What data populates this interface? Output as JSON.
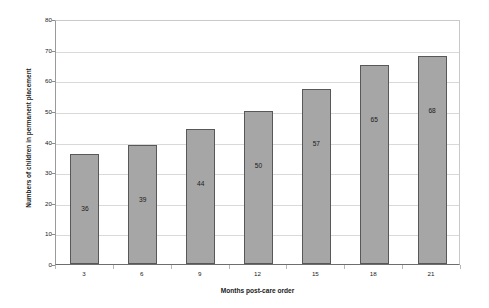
{
  "chart_data": {
    "type": "bar",
    "title": "",
    "xlabel": "Months post-care order",
    "ylabel": "Numbers of children in permanent placement",
    "categories": [
      "3",
      "6",
      "9",
      "12",
      "15",
      "18",
      "21"
    ],
    "values": [
      36,
      39,
      44,
      50,
      57,
      65,
      68
    ],
    "data_labels": [
      "36",
      "39",
      "44",
      "50",
      "57",
      "65",
      "68"
    ],
    "ylim": [
      0,
      80
    ],
    "ytick_step": 10,
    "yticks": [
      "0",
      "10",
      "20",
      "30",
      "40",
      "50",
      "60",
      "70",
      "80"
    ],
    "grid": "horizontal",
    "legend": "none",
    "series": [
      {
        "name": "Numbers of children in permanent placement",
        "values": [
          36,
          39,
          44,
          50,
          57,
          65,
          68
        ]
      }
    ],
    "colors": {
      "bar_fill": "#a6a6a6",
      "bar_border": "#585858",
      "gridline": "#d9d9d9",
      "axis": "#6e6e6e",
      "plot_border": "#c9c9c9",
      "text": "#1a1a1a",
      "background": "#ffffff"
    }
  }
}
